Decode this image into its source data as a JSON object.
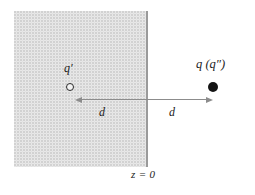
{
  "figure": {
    "background_color": "#ffffff"
  },
  "region": {
    "name": "shaded half-space",
    "fill_color": "#ededed",
    "dot_color": "#d2d2d2",
    "boundary_color": "#9a9a9a"
  },
  "labels": {
    "image_charge": "q′",
    "source_charge": "q (q″)",
    "distance_left": "d",
    "distance_right": "d",
    "plane": "z = 0"
  },
  "charges": [
    {
      "id": "image-charge",
      "label": "q′",
      "marker": "open-circle",
      "color": "#2b2b2b",
      "side": "inside shaded region"
    },
    {
      "id": "source-charge",
      "label": "q (q″)",
      "marker": "filled-circle",
      "color": "#141414",
      "side": "outside shaded region"
    }
  ],
  "dimensions": [
    {
      "id": "distance-left",
      "label": "d",
      "direction": "left",
      "color": "#8c8c8c"
    },
    {
      "id": "distance-right",
      "label": "d",
      "direction": "right",
      "color": "#8c8c8c"
    }
  ]
}
